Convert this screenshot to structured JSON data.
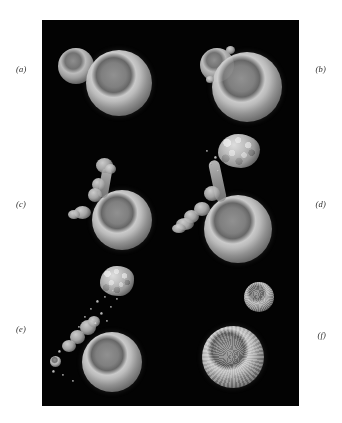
{
  "figure": {
    "background_color": "#ffffff",
    "plate_color": "#030303",
    "label_color": "#2b2b2b",
    "panel_labels": [
      {
        "id": "a",
        "text": "(a)",
        "side": "left"
      },
      {
        "id": "b",
        "text": "(b)",
        "side": "right"
      },
      {
        "id": "c",
        "text": "(c)",
        "side": "left"
      },
      {
        "id": "d",
        "text": "(d)",
        "side": "right"
      },
      {
        "id": "e",
        "text": "(e)",
        "side": "left"
      },
      {
        "id": "f",
        "text": "(f)",
        "side": "right"
      }
    ],
    "panels": [
      {
        "id": "a",
        "objects": "small smooth round cell upper-left adjacent to a larger smooth round cell with a bright annular rim and a darker central dome"
      },
      {
        "id": "b",
        "objects": "small round cell fused onto the upper-left shoulder of a larger round cell with bright annular rim and dark central dome"
      },
      {
        "id": "c",
        "objects": "rounded cell bearing an elongated lumpy protrusion rising from its upper-left surface plus a small lobed outgrowth at the lower-left"
      },
      {
        "id": "d",
        "objects": "rounded cell with a long stalked granular bleb extending up and to the right, a ruffled lobed margin at the lower-left, and faint detached particles near the stalk"
      },
      {
        "id": "e",
        "objects": "rounded cell with a ruffled lobed upper-left margin, a fully detached granular apoptotic body above it, and a scattered trail of small membrane vesicles between them"
      },
      {
        "id": "f",
        "objects": "two separate rounded bodies with coarsely textured surfaces: a smaller one upper-right and a larger one lower-left with a bright rim"
      }
    ]
  }
}
